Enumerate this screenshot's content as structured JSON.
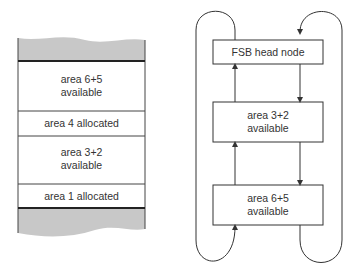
{
  "memory_map": {
    "blocks": [
      {
        "label_line1": "area 6+5",
        "label_line2": "available"
      },
      {
        "label_line1": "area 4 allocated",
        "label_line2": ""
      },
      {
        "label_line1": "area 3+2",
        "label_line2": "available"
      },
      {
        "label_line1": "area 1 allocated",
        "label_line2": ""
      }
    ]
  },
  "free_list": {
    "nodes": [
      {
        "label_line1": "FSB head node",
        "label_line2": ""
      },
      {
        "label_line1": "area 3+2",
        "label_line2": "available"
      },
      {
        "label_line1": "area 6+5",
        "label_line2": "available"
      }
    ]
  },
  "colors": {
    "shade": "#c8c8c8",
    "line": "#333333"
  }
}
